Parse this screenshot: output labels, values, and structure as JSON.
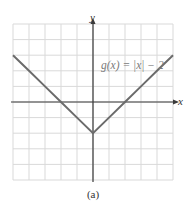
{
  "chart_data": {
    "type": "line",
    "title": "",
    "function_label": "g(x) = |x| − 2",
    "xlabel": "x",
    "ylabel": "y",
    "xlim": [
      -5,
      5
    ],
    "ylim": [
      -5,
      5
    ],
    "grid": true,
    "tick_labels_shown": false,
    "series": [
      {
        "name": "g(x) = |x| − 2",
        "x": [
          -5,
          -4,
          -3,
          -2,
          -1,
          0,
          1,
          2,
          3,
          4,
          5
        ],
        "y": [
          3,
          2,
          1,
          0,
          -1,
          -2,
          -1,
          0,
          1,
          2,
          3
        ],
        "color": "#6b6b6b"
      }
    ],
    "key_points": {
      "vertex": [
        0,
        -2
      ],
      "x_intercepts": [
        [
          -2,
          0
        ],
        [
          2,
          0
        ]
      ]
    },
    "caption": "(a)"
  },
  "colors": {
    "grid": "#d9d9d9",
    "axis": "#3a3a3a",
    "curve": "#6b6b6b",
    "label": "#7a7a7a"
  }
}
